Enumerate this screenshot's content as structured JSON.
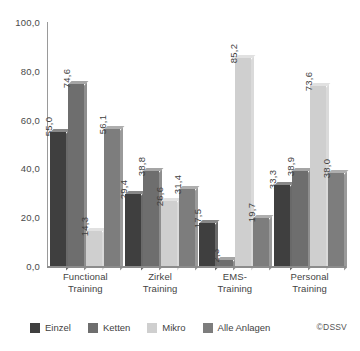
{
  "chart_data": {
    "type": "bar",
    "title": "",
    "subtitle": "",
    "xlabel": "",
    "ylabel": "",
    "ylim": [
      0,
      100
    ],
    "grid": false,
    "legend_position": "bottom",
    "categories": [
      "Functional\nTraining",
      "Zirkel\nTraining",
      "EMS-\nTraining",
      "Personal\nTraining"
    ],
    "category_lines": [
      [
        "Functional",
        "Training"
      ],
      [
        "Zirkel",
        "Training"
      ],
      [
        "EMS-",
        "Training"
      ],
      [
        "Personal",
        "Training"
      ]
    ],
    "y_ticks": [
      0,
      20,
      40,
      60,
      80,
      100
    ],
    "y_tick_labels": [
      "0,0",
      "20,0",
      "40,0",
      "60,0",
      "80,0",
      "100,0"
    ],
    "series": [
      {
        "name": "Einzel",
        "color": "#3f3f3f",
        "values": [
          55.0,
          29.4,
          17.5,
          33.3
        ],
        "labels": [
          "55,0",
          "29,4",
          "17,5",
          "33,3"
        ]
      },
      {
        "name": "Ketten",
        "color": "#6e6e6e",
        "values": [
          74.6,
          38.8,
          2.3,
          38.9
        ],
        "labels": [
          "74,6",
          "38,8",
          "2,3",
          "38,9"
        ]
      },
      {
        "name": "Mikro",
        "color": "#cfcfcf",
        "values": [
          14.3,
          26.6,
          85.2,
          73.6
        ],
        "labels": [
          "14,3",
          "26,6",
          "85,2",
          "73,6"
        ]
      },
      {
        "name": "Alle Anlagen",
        "color": "#7d7d7d",
        "values": [
          56.1,
          31.4,
          19.7,
          38.0
        ],
        "labels": [
          "56,1",
          "31,4",
          "19,7",
          "38,0"
        ]
      }
    ],
    "credit": "©DSSV"
  },
  "legend": {
    "items": [
      {
        "label": "Einzel",
        "color": "#3f3f3f"
      },
      {
        "label": "Ketten",
        "color": "#6e6e6e"
      },
      {
        "label": "Mikro",
        "color": "#cfcfcf"
      },
      {
        "label": "Alle Anlagen",
        "color": "#7d7d7d"
      }
    ]
  }
}
